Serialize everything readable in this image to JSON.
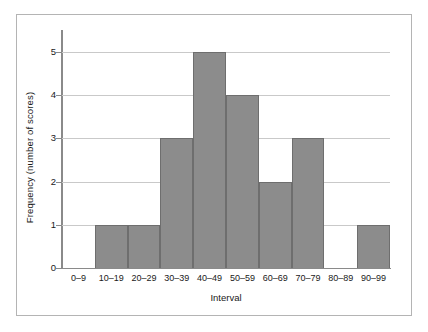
{
  "chart_data": {
    "type": "bar",
    "title": "",
    "subtitle": "",
    "xlabel": "Interval",
    "ylabel": "Frequency (number of scores)",
    "categories": [
      "0–9",
      "10–19",
      "20–29",
      "30–39",
      "40–49",
      "50–59",
      "60–69",
      "70–79",
      "80–89",
      "90–99"
    ],
    "values": [
      0,
      1,
      1,
      3,
      5,
      4,
      2,
      3,
      0,
      1
    ],
    "ylim": [
      0,
      5
    ],
    "xlim_note": "categorical bins, contiguous histogram bars",
    "yticks": [
      0,
      1,
      2,
      3,
      4,
      5
    ],
    "ytick_labels": [
      "0",
      "1",
      "2",
      "3",
      "4",
      "5"
    ],
    "grid": "horizontal gridlines at 1, 2, 3, 4, 5",
    "legend": null,
    "legend_position": "none",
    "annotations": [],
    "bar_color": "#8c8c8c",
    "bar_edge_color": "#6e6e6e",
    "gridline_color": "#c9c9c9",
    "axis_color": "#8a8a8a",
    "frame_color": "#b4b4b4",
    "background_color": "#ffffff",
    "text_color": "#1a1a1a"
  }
}
